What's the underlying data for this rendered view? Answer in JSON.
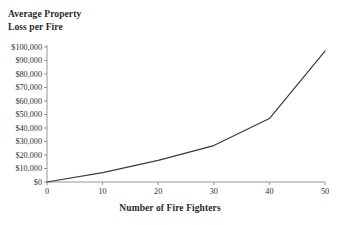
{
  "chart_data": {
    "type": "line",
    "title": "",
    "ylabel": "Average Property\nLoss per Fire",
    "xlabel": "Number of Fire Fighters",
    "x": [
      0,
      10,
      20,
      30,
      40,
      50
    ],
    "values": [
      0,
      7000,
      16000,
      27000,
      47000,
      97000
    ],
    "series": [
      {
        "name": "Average Property Loss per Fire",
        "values": [
          0,
          7000,
          16000,
          27000,
          47000,
          97000
        ]
      }
    ],
    "xlim": [
      0,
      50
    ],
    "ylim": [
      0,
      100000
    ],
    "x_ticks": [
      0,
      10,
      20,
      30,
      40,
      50
    ],
    "x_tick_labels": [
      "0",
      "10",
      "20",
      "30",
      "40",
      "50"
    ],
    "y_ticks": [
      0,
      10000,
      20000,
      30000,
      40000,
      50000,
      60000,
      70000,
      80000,
      90000,
      100000
    ],
    "y_tick_labels": [
      "$0",
      "$10,000",
      "$20,000",
      "$30,000",
      "$40,000",
      "$50,000",
      "$60,000",
      "$70,000",
      "$80,000",
      "$90,000",
      "$100,000"
    ],
    "grid": false,
    "legend": false,
    "line_color": "#3a3a3a",
    "axis_color": "#8a8a8a",
    "background_color": "#ffffff"
  }
}
